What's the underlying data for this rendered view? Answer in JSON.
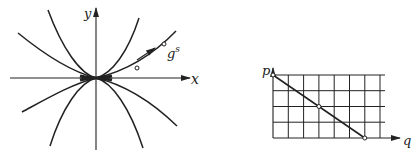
{
  "left_figure": {
    "type": "phase-portrait",
    "x_axis_label": "x",
    "y_axis_label": "y",
    "flow_label": "g",
    "flow_superscript": "s"
  },
  "right_figure": {
    "type": "grid-line-plot",
    "y_axis_label": "p",
    "x_axis_label": "q",
    "grid": {
      "columns": 7,
      "rows": 4
    },
    "line": {
      "from": [
        0,
        4
      ],
      "to": [
        6,
        0
      ]
    },
    "marked_points": [
      [
        0,
        4
      ],
      [
        3,
        2
      ],
      [
        6,
        0
      ]
    ]
  },
  "colors": {
    "ink": "#222222",
    "background": "#ffffff"
  }
}
